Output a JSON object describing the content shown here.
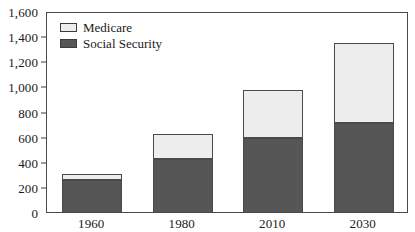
{
  "chart_data": {
    "type": "bar",
    "stacked": true,
    "title": "",
    "subtitle": "",
    "xlabel": "",
    "ylabel": "",
    "categories": [
      "1960",
      "1980",
      "2010",
      "2030"
    ],
    "series": [
      {
        "name": "Social Security",
        "color": "#565656",
        "values": [
          265,
          430,
          600,
          715
        ]
      },
      {
        "name": "Medicare",
        "color": "#ededed",
        "values": [
          45,
          200,
          380,
          635
        ]
      }
    ],
    "totals": [
      310,
      630,
      980,
      1350
    ],
    "ylim": [
      0,
      1600
    ],
    "ytick_values": [
      0,
      200,
      400,
      600,
      800,
      1000,
      1200,
      1400,
      1600
    ],
    "ytick_labels": [
      "0",
      "200",
      "400",
      "600",
      "800",
      "1,000",
      "1,200",
      "1,400",
      "1,600"
    ],
    "grid": false,
    "legend_position": "top-left-inside",
    "legend_entries": [
      "Medicare",
      "Social Security"
    ],
    "frame": true,
    "axis_color": "#4a4a4a"
  }
}
